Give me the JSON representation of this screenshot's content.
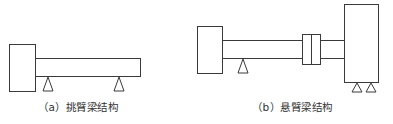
{
  "diagrams": [
    {
      "id": "a",
      "caption": "（a）挑臂梁结构",
      "components": [
        "motor-block",
        "beam",
        "support-left",
        "support-right"
      ]
    },
    {
      "id": "b",
      "caption": "（b）悬臂梁结构",
      "components": [
        "motor-block",
        "shaft",
        "support",
        "coupling",
        "housing-block",
        "base-support-left",
        "base-support-right"
      ]
    }
  ],
  "colors": {
    "stroke": "#3a3a3a",
    "background": "#ffffff",
    "text": "#333333"
  }
}
